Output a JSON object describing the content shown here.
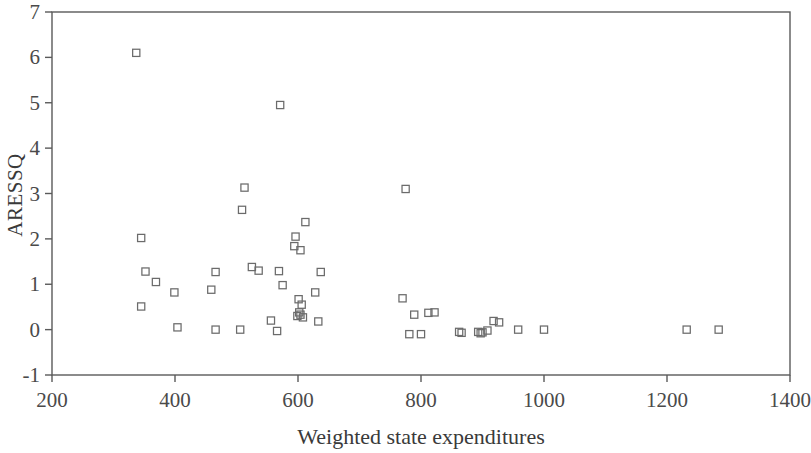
{
  "chart_data": {
    "type": "scatter",
    "title": "",
    "xlabel": "Weighted state expenditures",
    "ylabel": "ARESSQ",
    "xlim": [
      200,
      1400
    ],
    "ylim": [
      -1,
      7
    ],
    "xticks": [
      200,
      400,
      600,
      800,
      1000,
      1200,
      1400
    ],
    "yticks": [
      -1,
      0,
      1,
      2,
      3,
      4,
      5,
      6,
      7
    ],
    "grid": false,
    "legend": null,
    "marker": "open-square",
    "marker_color": "#6b6b6b",
    "frame_color": "#5a5a5a",
    "series": [
      {
        "name": "ARESSQ vs Weighted state expenditures",
        "points": [
          [
            337,
            6.1
          ],
          [
            571,
            4.95
          ],
          [
            513,
            3.13
          ],
          [
            775,
            3.1
          ],
          [
            509,
            2.64
          ],
          [
            612,
            2.37
          ],
          [
            345,
            2.02
          ],
          [
            596,
            2.05
          ],
          [
            594,
            1.84
          ],
          [
            604,
            1.75
          ],
          [
            352,
            1.28
          ],
          [
            466,
            1.27
          ],
          [
            525,
            1.38
          ],
          [
            536,
            1.3
          ],
          [
            569,
            1.29
          ],
          [
            637,
            1.27
          ],
          [
            369,
            1.05
          ],
          [
            575,
            0.98
          ],
          [
            399,
            0.82
          ],
          [
            459,
            0.88
          ],
          [
            628,
            0.82
          ],
          [
            345,
            0.51
          ],
          [
            601,
            0.67
          ],
          [
            606,
            0.55
          ],
          [
            770,
            0.69
          ],
          [
            556,
            0.2
          ],
          [
            633,
            0.18
          ],
          [
            602,
            0.38
          ],
          [
            604,
            0.33
          ],
          [
            599,
            0.3
          ],
          [
            608,
            0.27
          ],
          [
            789,
            0.33
          ],
          [
            812,
            0.37
          ],
          [
            822,
            0.38
          ],
          [
            404,
            0.05
          ],
          [
            466,
            0.0
          ],
          [
            506,
            0.0
          ],
          [
            566,
            -0.03
          ],
          [
            781,
            -0.1
          ],
          [
            800,
            -0.1
          ],
          [
            862,
            -0.05
          ],
          [
            866,
            -0.07
          ],
          [
            893,
            -0.05
          ],
          [
            897,
            -0.08
          ],
          [
            900,
            -0.06
          ],
          [
            918,
            0.19
          ],
          [
            927,
            0.16
          ],
          [
            908,
            -0.02
          ],
          [
            958,
            0.0
          ],
          [
            1000,
            0.0
          ],
          [
            1232,
            0.0
          ],
          [
            1284,
            0.0
          ]
        ]
      }
    ]
  },
  "axes": {
    "x_tick_labels": [
      "200",
      "400",
      "600",
      "800",
      "1000",
      "1200",
      "1400"
    ],
    "y_tick_labels": [
      "-1",
      "0",
      "1",
      "2",
      "3",
      "4",
      "5",
      "6",
      "7"
    ],
    "x_title": "Weighted state expenditures",
    "y_title": "ARESSQ"
  }
}
